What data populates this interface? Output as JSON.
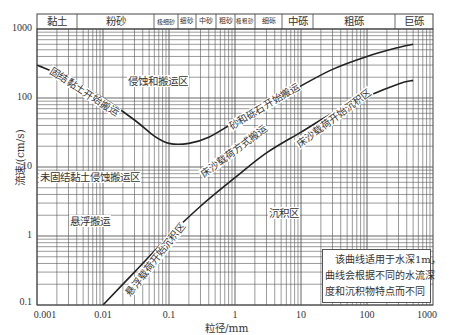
{
  "chart_data": {
    "type": "line",
    "title": "",
    "xlabel": "粒径/mm",
    "ylabel": "流速/(cm/s)",
    "xscale": "log",
    "yscale": "log",
    "xlim": [
      0.001,
      1000
    ],
    "ylim": [
      0.1,
      1000
    ],
    "grid": true,
    "x_tick_labels": [
      "0.001",
      "0.01",
      "0.1",
      "1",
      "10",
      "100",
      "1000"
    ],
    "y_tick_labels": [
      "0.1",
      "1",
      "10",
      "100",
      "1000"
    ],
    "grain_size_bands": [
      {
        "label": "黏土",
        "from": 0.001,
        "to": 0.004
      },
      {
        "label": "粉砂",
        "from": 0.004,
        "to": 0.0625
      },
      {
        "label": "极细砂",
        "from": 0.0625,
        "to": 0.125
      },
      {
        "label": "细砂",
        "from": 0.125,
        "to": 0.25
      },
      {
        "label": "中砂",
        "from": 0.25,
        "to": 0.5
      },
      {
        "label": "粗砂",
        "from": 0.5,
        "to": 1
      },
      {
        "label": "极粗砂",
        "from": 1,
        "to": 2
      },
      {
        "label": "细砾",
        "from": 2,
        "to": 5
      },
      {
        "label": "中砾",
        "from": 5,
        "to": 15
      },
      {
        "label": "粗砾",
        "from": 15,
        "to": 256
      },
      {
        "label": "巨砾",
        "from": 256,
        "to": 1000
      }
    ],
    "series": [
      {
        "name": "erosion_threshold",
        "labels": [
          "固结黏土开始搬运",
          "砂和砾石开始搬运"
        ],
        "x": [
          0.001,
          0.003,
          0.01,
          0.03,
          0.06,
          0.1,
          0.2,
          0.4,
          1,
          3,
          10,
          30,
          100,
          300,
          500
        ],
        "y": [
          300,
          190,
          100,
          48,
          28,
          22,
          22,
          27,
          45,
          80,
          150,
          260,
          400,
          540,
          600
        ]
      },
      {
        "name": "deposition_threshold",
        "labels": [
          "悬浮载荷开始沉积区",
          "床沙载荷开始沉积区"
        ],
        "x": [
          0.01,
          0.03,
          0.1,
          0.3,
          1,
          3,
          10,
          30,
          100,
          300,
          500
        ],
        "y": [
          0.1,
          0.3,
          1.0,
          2.7,
          7.0,
          16,
          32,
          60,
          105,
          160,
          180
        ]
      }
    ],
    "regions": [
      {
        "label": "侵蚀和搬运区"
      },
      {
        "label": "未固结黏土侵蚀搬运区"
      },
      {
        "label": "悬浮搬运"
      },
      {
        "label": "床沙载荷方式搬运"
      },
      {
        "label": "沉积区"
      }
    ],
    "annotation": "该曲线适用于水深1m，曲线会根据不同的水流深度和沉积物特点而不同"
  },
  "axes": {
    "xlabel": "粒径/mm",
    "ylabel": "流速/(cm/s)",
    "xticks": [
      "0.001",
      "0.01",
      "0.1",
      "1",
      "10",
      "100",
      "1000"
    ],
    "yticks": [
      "1000",
      "100",
      "10",
      "1",
      "0.1"
    ]
  },
  "bands": [
    "黏土",
    "粉砂",
    "极细砂",
    "细砂",
    "中砂",
    "粗砂",
    "极粗砂",
    "细砾",
    "中砾",
    "粗砾",
    "巨砾"
  ],
  "curve_labels": {
    "consolidated_clay": "固结黏土开始搬运",
    "sand_gravel": "砂和砾石开始搬运",
    "suspended_deposit": "悬浮载荷开始沉积区",
    "bedload_deposit": "床沙载荷开始沉积区"
  },
  "zones": {
    "erosion": "侵蚀和搬运区",
    "unconsolidated": "未固结黏土侵蚀搬运区",
    "suspension": "悬浮搬运",
    "bedload": "床沙载荷方式搬运",
    "deposition": "沉积区"
  },
  "note": {
    "line1": "该曲线适用于水深1m，",
    "line2": "曲线会根据不同的水流深",
    "line3": "度和沉积物特点而不同"
  }
}
